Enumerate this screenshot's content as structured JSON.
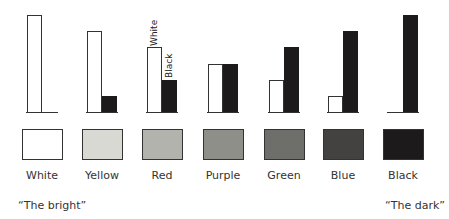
{
  "diagram": {
    "title": "",
    "bar_legend": {
      "white_label": "White",
      "black_label": "Black"
    },
    "max_height": 100,
    "colors": [
      {
        "name": "White",
        "white_component": 100,
        "black_component": 0,
        "swatch_color": "#ffffff"
      },
      {
        "name": "Yellow",
        "white_component": 83,
        "black_component": 17,
        "swatch_color": "#d9d9d4"
      },
      {
        "name": "Red",
        "white_component": 67,
        "black_component": 33,
        "swatch_color": "#b3b3ae"
      },
      {
        "name": "Purple",
        "white_component": 50,
        "black_component": 50,
        "swatch_color": "#8f8f8a"
      },
      {
        "name": "Green",
        "white_component": 33,
        "black_component": 67,
        "swatch_color": "#6e6e6a"
      },
      {
        "name": "Blue",
        "white_component": 17,
        "black_component": 83,
        "swatch_color": "#434241"
      },
      {
        "name": "Black",
        "white_component": 0,
        "black_component": 100,
        "swatch_color": "#1c1a1a"
      }
    ],
    "captions": {
      "left": "“The bright”",
      "right": "“The dark”"
    }
  }
}
